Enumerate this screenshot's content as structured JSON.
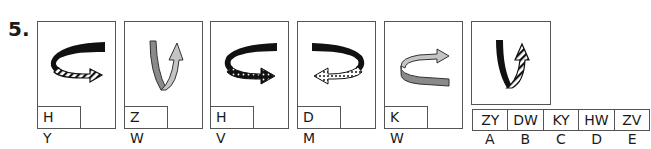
{
  "question": {
    "number": "5."
  },
  "cards": [
    {
      "label": "H Y",
      "arrow": "black-to-striped-horizontal-right"
    },
    {
      "label": "Z W",
      "arrow": "gray-to-lightgray-vertical-up"
    },
    {
      "label": "H V",
      "arrow": "black-to-dotted-horizontal-right"
    },
    {
      "label": "D M",
      "arrow": "black-to-white-dotted-horizontal-left"
    },
    {
      "label": "K W",
      "arrow": "gray-to-lightgray-horizontal-right-rear"
    }
  ],
  "question_card": {
    "arrow": "black-to-striped-vertical-up"
  },
  "answers": [
    {
      "code": "ZY",
      "letter": "A"
    },
    {
      "code": "DW",
      "letter": "B"
    },
    {
      "code": "KY",
      "letter": "C"
    },
    {
      "code": "HW",
      "letter": "D"
    },
    {
      "code": "ZV",
      "letter": "E"
    }
  ],
  "colors": {
    "border": "#555555",
    "black": "#111111",
    "gray": "#8a8a8a",
    "lightgray": "#c4c4c4"
  }
}
